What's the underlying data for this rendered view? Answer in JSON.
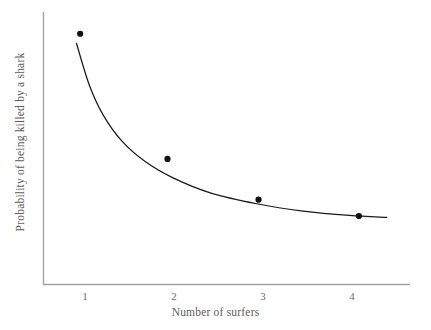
{
  "chart_data": {
    "type": "scatter",
    "title": "",
    "xlabel": "Number of surfers",
    "ylabel": "Probability of being killed by a shark",
    "x": [
      1,
      2,
      3,
      4
    ],
    "values": [
      0.92,
      0.46,
      0.31,
      0.25
    ],
    "categories": [
      "1",
      "2",
      "3",
      "4"
    ],
    "xticklabels": [
      "1",
      "2",
      "3",
      "4"
    ],
    "yticklabels": [],
    "xlim": [
      0.6,
      4.55
    ],
    "ylim": [
      0,
      1
    ],
    "grid": false,
    "legend": false,
    "series": [
      {
        "name": "observed points",
        "type": "scatter",
        "marker": "filled-circle",
        "color": "#111111",
        "points": [
          {
            "x": 1.0,
            "y": 0.92
          },
          {
            "x": 1.94,
            "y": 0.46
          },
          {
            "x": 2.92,
            "y": 0.31
          },
          {
            "x": 4.0,
            "y": 0.25
          }
        ]
      },
      {
        "name": "fitted decay curve",
        "type": "line",
        "color": "#1a1a1a",
        "points": [
          {
            "x": 0.96,
            "y": 0.885
          },
          {
            "x": 1.1,
            "y": 0.73
          },
          {
            "x": 1.25,
            "y": 0.62
          },
          {
            "x": 1.45,
            "y": 0.525
          },
          {
            "x": 1.7,
            "y": 0.45
          },
          {
            "x": 2.0,
            "y": 0.39
          },
          {
            "x": 2.4,
            "y": 0.335
          },
          {
            "x": 2.9,
            "y": 0.295
          },
          {
            "x": 3.4,
            "y": 0.268
          },
          {
            "x": 3.9,
            "y": 0.252
          },
          {
            "x": 4.3,
            "y": 0.245
          }
        ]
      }
    ]
  },
  "axes": {
    "axis_color": "#a0a0a0",
    "curve_color": "#1a1a1a",
    "marker_color": "#111111",
    "background": "#ffffff",
    "label_color": "#5d5d5d",
    "tick_color": "#6e6e6e"
  }
}
